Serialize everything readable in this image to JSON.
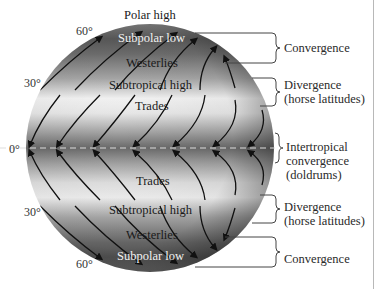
{
  "diagram": {
    "zones": {
      "polar_high_n": "Polar high",
      "subpolar_low_n": "Subpolar low",
      "westerlies_n": "Westerlies",
      "subtropical_high_n": "Subtropical high",
      "trades_n": "Trades",
      "trades_s": "Trades",
      "subtropical_high_s": "Subtropical high",
      "westerlies_s": "Westerlies",
      "subpolar_low_s": "Subpolar low"
    },
    "latitudes": {
      "lat60n": "60°",
      "lat30n": "30°",
      "equator": "0°",
      "lat30s": "30°",
      "lat60s": "60°"
    },
    "annotations": [
      {
        "lines": [
          "Convergence"
        ]
      },
      {
        "lines": [
          "Divergence",
          "(horse latitudes)"
        ]
      },
      {
        "lines": [
          "Intertropical",
          "convergence",
          "(doldrums)"
        ]
      },
      {
        "lines": [
          "Divergence",
          "(horse latitudes)"
        ]
      },
      {
        "lines": [
          "Convergence"
        ]
      }
    ],
    "colors": {
      "globe_dark": "#4a4a4a",
      "globe_light": "#f4f4f4",
      "arrows": "#111111",
      "equator_dash": "#dddddd"
    }
  }
}
